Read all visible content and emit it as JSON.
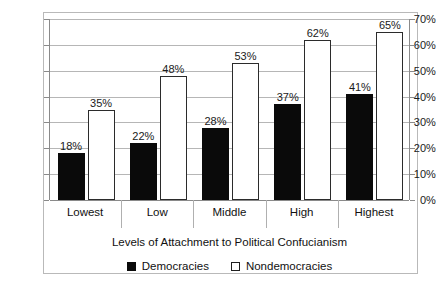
{
  "chart_data": {
    "type": "bar",
    "title": "",
    "xlabel": "Levels of Attachment to Political Confucianism",
    "ylabel": "",
    "categories": [
      "Lowest",
      "Low",
      "Middle",
      "High",
      "Highest"
    ],
    "series": [
      {
        "name": "Democracies",
        "values": [
          18,
          22,
          28,
          37,
          41
        ],
        "labels": [
          "18%",
          "22%",
          "28%",
          "37%",
          "41%"
        ],
        "color": "#0a0a0a",
        "style": "filled"
      },
      {
        "name": "Nondemocracies",
        "values": [
          35,
          48,
          53,
          62,
          65
        ],
        "labels": [
          "35%",
          "48%",
          "53%",
          "62%",
          "65%"
        ],
        "color": "#ffffff",
        "style": "hollow"
      }
    ],
    "ylim": [
      0,
      70
    ],
    "ytick_values": [
      0,
      10,
      20,
      30,
      40,
      50,
      60,
      70
    ],
    "ytick_labels": [
      "0%",
      "10%",
      "20%",
      "30%",
      "40%",
      "50%",
      "60%",
      "70%"
    ],
    "grid": true,
    "legend_position": "bottom",
    "value_labels": true
  },
  "legend": {
    "items": [
      {
        "label": "Democracies",
        "swatch": "filled-square-icon"
      },
      {
        "label": "Nondemocracies",
        "swatch": "hollow-square-icon"
      }
    ]
  }
}
